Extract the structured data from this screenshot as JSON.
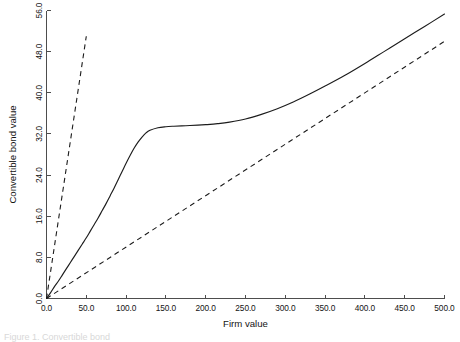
{
  "chart_data": {
    "type": "line",
    "title": "",
    "xlabel": "Firm value",
    "ylabel": "Convertible bond value",
    "xlim": [
      0.0,
      500.0
    ],
    "ylim": [
      0.0,
      56.0
    ],
    "grid": false,
    "legend_position": "none",
    "x_ticks": [
      "0.0",
      "50.0",
      "100.0",
      "150.0",
      "200.0",
      "250.0",
      "300.0",
      "350.0",
      "400.0",
      "450.0",
      "500.0"
    ],
    "x_tick_values": [
      0,
      50,
      100,
      150,
      200,
      250,
      300,
      350,
      400,
      450,
      500
    ],
    "y_ticks": [
      "0.0",
      "8.0",
      "16.0",
      "24.0",
      "32.0",
      "40.0",
      "48.0",
      "56.0"
    ],
    "y_tick_values": [
      0,
      8,
      16,
      24,
      32,
      40,
      48,
      56
    ],
    "series": [
      {
        "name": "Convertible bond value",
        "style": "solid",
        "color": "#1c1c1c",
        "x": [
          0,
          5,
          10,
          15,
          20,
          25,
          30,
          35,
          40,
          45,
          50,
          55,
          60,
          65,
          70,
          75,
          80,
          85,
          90,
          95,
          100,
          105,
          110,
          115,
          120,
          125,
          130,
          140,
          150,
          160,
          175,
          190,
          200,
          215,
          230,
          250,
          270,
          290,
          310,
          330,
          350,
          375,
          400,
          425,
          450,
          475,
          500
        ],
        "y": [
          0.0,
          1.1,
          2.3,
          3.4,
          4.6,
          5.8,
          7.0,
          8.2,
          9.4,
          10.6,
          11.8,
          13.1,
          14.4,
          15.7,
          17.1,
          18.5,
          20.0,
          21.5,
          23.1,
          24.7,
          26.3,
          27.8,
          29.2,
          30.4,
          31.4,
          32.2,
          32.7,
          33.2,
          33.4,
          33.5,
          33.6,
          33.7,
          33.8,
          34.0,
          34.3,
          34.9,
          35.8,
          36.9,
          38.2,
          39.7,
          41.3,
          43.4,
          45.7,
          48.1,
          50.5,
          52.9,
          55.3
        ]
      },
      {
        "name": "Conversion value",
        "style": "dashed",
        "color": "#1c1c1c",
        "x": [
          0,
          50
        ],
        "y": [
          0.0,
          51.0
        ]
      },
      {
        "name": "Straight bond value",
        "style": "dashed",
        "color": "#1c1c1c",
        "x": [
          0,
          500
        ],
        "y": [
          0.0,
          50.0
        ]
      }
    ]
  },
  "caption": {
    "text": "Figure 1. Convertible bond"
  },
  "colors": {
    "line": "#1c1c1c",
    "axis": "#4d4d4d",
    "background": "#ffffff"
  }
}
